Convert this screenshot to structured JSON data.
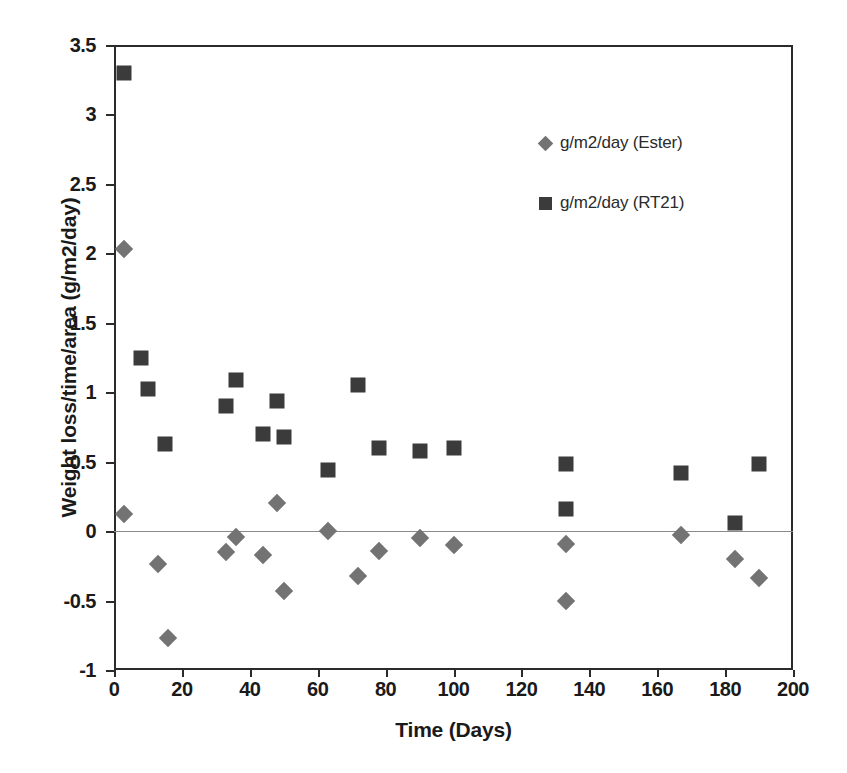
{
  "chart_data": {
    "type": "scatter",
    "title": "",
    "xlabel": "Time (Days)",
    "ylabel": "Weight loss/time/area (g/m2/day)",
    "xlim": [
      0,
      200
    ],
    "ylim": [
      -1,
      3.5
    ],
    "xticks": [
      0,
      20,
      40,
      60,
      80,
      100,
      120,
      140,
      160,
      180,
      200
    ],
    "xtick_labels": [
      "0",
      "20",
      "40",
      "60",
      "80",
      "100",
      "120",
      "140",
      "160",
      "180",
      "200"
    ],
    "yticks": [
      -1,
      -0.5,
      0,
      0.5,
      1,
      1.5,
      2,
      2.5,
      3,
      3.5
    ],
    "ytick_labels": [
      "-1",
      "-0.5",
      "0",
      "0.5",
      "1",
      "1.5",
      "2",
      "2.5",
      "3",
      "3.5"
    ],
    "grid": false,
    "zero_line": true,
    "legend_position": "upper-right-inside",
    "series": [
      {
        "name": "g/m2/day (Ester)",
        "marker": "diamond",
        "color": "#737373",
        "points": [
          {
            "x": 3,
            "y": 2.03
          },
          {
            "x": 3,
            "y": 0.12
          },
          {
            "x": 13,
            "y": -0.24
          },
          {
            "x": 16,
            "y": -0.77
          },
          {
            "x": 33,
            "y": -0.15
          },
          {
            "x": 36,
            "y": -0.04
          },
          {
            "x": 44,
            "y": -0.17
          },
          {
            "x": 48,
            "y": 0.2
          },
          {
            "x": 50,
            "y": -0.43
          },
          {
            "x": 63,
            "y": 0.0
          },
          {
            "x": 72,
            "y": -0.32
          },
          {
            "x": 78,
            "y": -0.14
          },
          {
            "x": 90,
            "y": -0.05
          },
          {
            "x": 100,
            "y": -0.1
          },
          {
            "x": 133,
            "y": -0.09
          },
          {
            "x": 133,
            "y": -0.5
          },
          {
            "x": 167,
            "y": -0.03
          },
          {
            "x": 183,
            "y": -0.2
          },
          {
            "x": 190,
            "y": -0.34
          }
        ]
      },
      {
        "name": "g/m2/day (RT21)",
        "marker": "square",
        "color": "#3b3b3b",
        "points": [
          {
            "x": 3,
            "y": 3.3
          },
          {
            "x": 8,
            "y": 1.25
          },
          {
            "x": 10,
            "y": 1.02
          },
          {
            "x": 15,
            "y": 0.63
          },
          {
            "x": 33,
            "y": 0.9
          },
          {
            "x": 36,
            "y": 1.09
          },
          {
            "x": 44,
            "y": 0.7
          },
          {
            "x": 48,
            "y": 0.94
          },
          {
            "x": 50,
            "y": 0.68
          },
          {
            "x": 63,
            "y": 0.44
          },
          {
            "x": 72,
            "y": 1.05
          },
          {
            "x": 78,
            "y": 0.6
          },
          {
            "x": 90,
            "y": 0.58
          },
          {
            "x": 100,
            "y": 0.6
          },
          {
            "x": 133,
            "y": 0.48
          },
          {
            "x": 133,
            "y": 0.16
          },
          {
            "x": 167,
            "y": 0.42
          },
          {
            "x": 183,
            "y": 0.06
          },
          {
            "x": 190,
            "y": 0.48
          }
        ]
      }
    ]
  },
  "legend": {
    "entries": [
      {
        "label": "g/m2/day (Ester)",
        "marker": "diamond"
      },
      {
        "label": "g/m2/day (RT21)",
        "marker": "square"
      }
    ]
  },
  "colors": {
    "ester_marker": "#737373",
    "rt21_marker": "#3b3b3b",
    "axis": "#2b2b2b",
    "zero_line": "#8a8a8a",
    "background": "#ffffff"
  }
}
